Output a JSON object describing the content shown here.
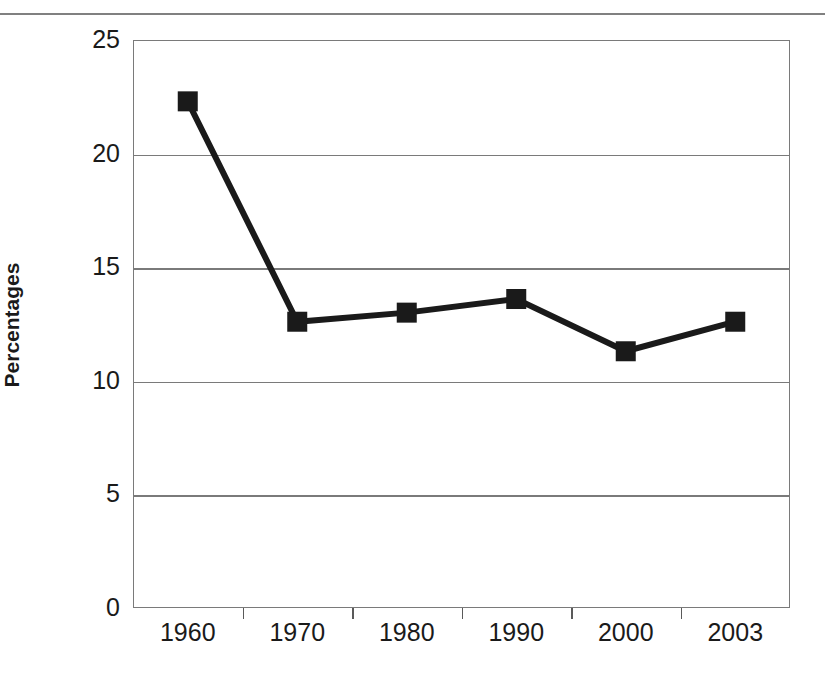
{
  "chart_data": {
    "type": "line",
    "title": "",
    "xlabel": "",
    "ylabel": "Percentages",
    "categories": [
      "1960",
      "1970",
      "1980",
      "1990",
      "2000",
      "2003"
    ],
    "values": [
      22.3,
      12.6,
      13.0,
      13.6,
      11.3,
      12.6
    ],
    "series": [
      {
        "name": "Percentages",
        "values": [
          22.3,
          12.6,
          13.0,
          13.6,
          11.3,
          12.6
        ]
      }
    ],
    "ylim": [
      0,
      25
    ],
    "yticks": [
      0,
      5,
      10,
      15,
      20,
      25
    ],
    "ytick_labels": [
      "0",
      "5",
      "10",
      "15",
      "20",
      "25"
    ],
    "grid": "horizontal",
    "legend": "none",
    "marker": "filled-square",
    "line_color": "#1a1a1a",
    "marker_color": "#1a1a1a",
    "grid_color": "#7a7a7a",
    "background_color": "#ffffff",
    "axis_label_color": "#1a1a1a"
  },
  "figure": {
    "top_rule": "horizontal-rule",
    "y_axis_title": "Percentages"
  }
}
